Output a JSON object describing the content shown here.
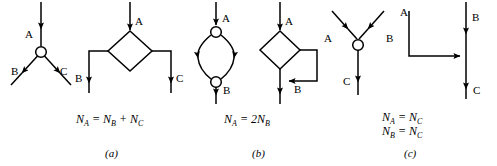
{
  "figure": {
    "background_color": "#ffffff",
    "stroke_color": "#000000",
    "panels": [
      {
        "caption": "(a)",
        "equations": [
          "N_A = N_B + N_C"
        ],
        "node_labels": [
          "A",
          "B",
          "C",
          "A",
          "B",
          "C"
        ]
      },
      {
        "caption": "(b)",
        "equations": [
          "N_A = 2N_B"
        ],
        "node_labels": [
          "A",
          "B",
          "A",
          "B"
        ]
      },
      {
        "caption": "(c)",
        "equations": [
          "N_A = N_C",
          "N_B = N_C"
        ],
        "node_labels": [
          "A",
          "B",
          "C",
          "A",
          "B",
          "C"
        ]
      }
    ]
  },
  "panel_a": {
    "graph_labels": {
      "in_a": "A",
      "out_b": "B",
      "out_c": "C"
    },
    "block_labels": {
      "in_a": "A",
      "out_b": "B",
      "out_c": "C"
    },
    "equation": {
      "lhs_var": "N",
      "lhs_sub": "A",
      "eq": "=",
      "t1_var": "N",
      "t1_sub": "B",
      "plus": "+",
      "t2_var": "N",
      "t2_sub": "C"
    },
    "caption": "(a)"
  },
  "panel_b": {
    "graph_labels": {
      "in_a": "A",
      "out_b": "B"
    },
    "block_labels": {
      "in_a": "A",
      "fb_b": "B"
    },
    "equation": {
      "lhs_var": "N",
      "lhs_sub": "A",
      "eq": "=",
      "coef": "2",
      "rhs_var": "N",
      "rhs_sub": "B"
    },
    "caption": "(b)"
  },
  "panel_c": {
    "graph_labels": {
      "in_a": "A",
      "in_b": "B",
      "out_c": "C"
    },
    "block_labels": {
      "in_a": "A",
      "in_b": "B",
      "out_c": "C"
    },
    "equation_1": {
      "lhs_var": "N",
      "lhs_sub": "A",
      "eq": "=",
      "rhs_var": "N",
      "rhs_sub": "C"
    },
    "equation_2": {
      "lhs_var": "N",
      "lhs_sub": "B",
      "eq": "=",
      "rhs_var": "N",
      "rhs_sub": "C"
    },
    "caption": "(c)"
  }
}
